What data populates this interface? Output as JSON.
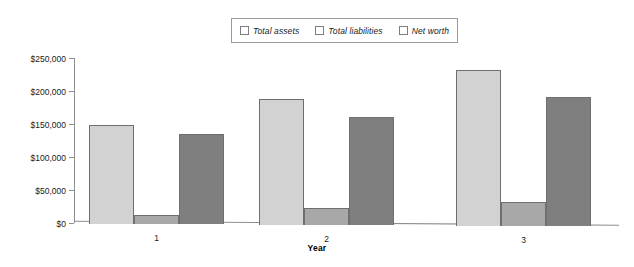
{
  "chart_data": {
    "type": "bar",
    "title": "",
    "xlabel": "Year",
    "ylabel": "",
    "categories": [
      "1",
      "2",
      "3"
    ],
    "series": [
      {
        "name": "Total assets",
        "color": "#d2d2d2",
        "values": [
          150000,
          190000,
          237000
        ]
      },
      {
        "name": "Total liabilities",
        "color": "#a8a8a8",
        "values": [
          13000,
          25000,
          37000
        ]
      },
      {
        "name": "Net worth",
        "color": "#7f7f7f",
        "values": [
          135000,
          163000,
          196000
        ]
      }
    ],
    "ylim": [
      0,
      250000
    ],
    "ytick_values": [
      250000,
      200000,
      150000,
      100000,
      50000,
      0
    ],
    "ytick_labels": [
      "$250,000",
      "$200,000",
      "$150,000",
      "$100,000",
      "$50,000",
      "$0"
    ],
    "grid": false,
    "legend_position": "top-center"
  },
  "legend": {
    "items": [
      {
        "label": "Total assets"
      },
      {
        "label": "Total liabilities"
      },
      {
        "label": "Net worth"
      }
    ]
  },
  "axes": {
    "x_title": "Year"
  }
}
